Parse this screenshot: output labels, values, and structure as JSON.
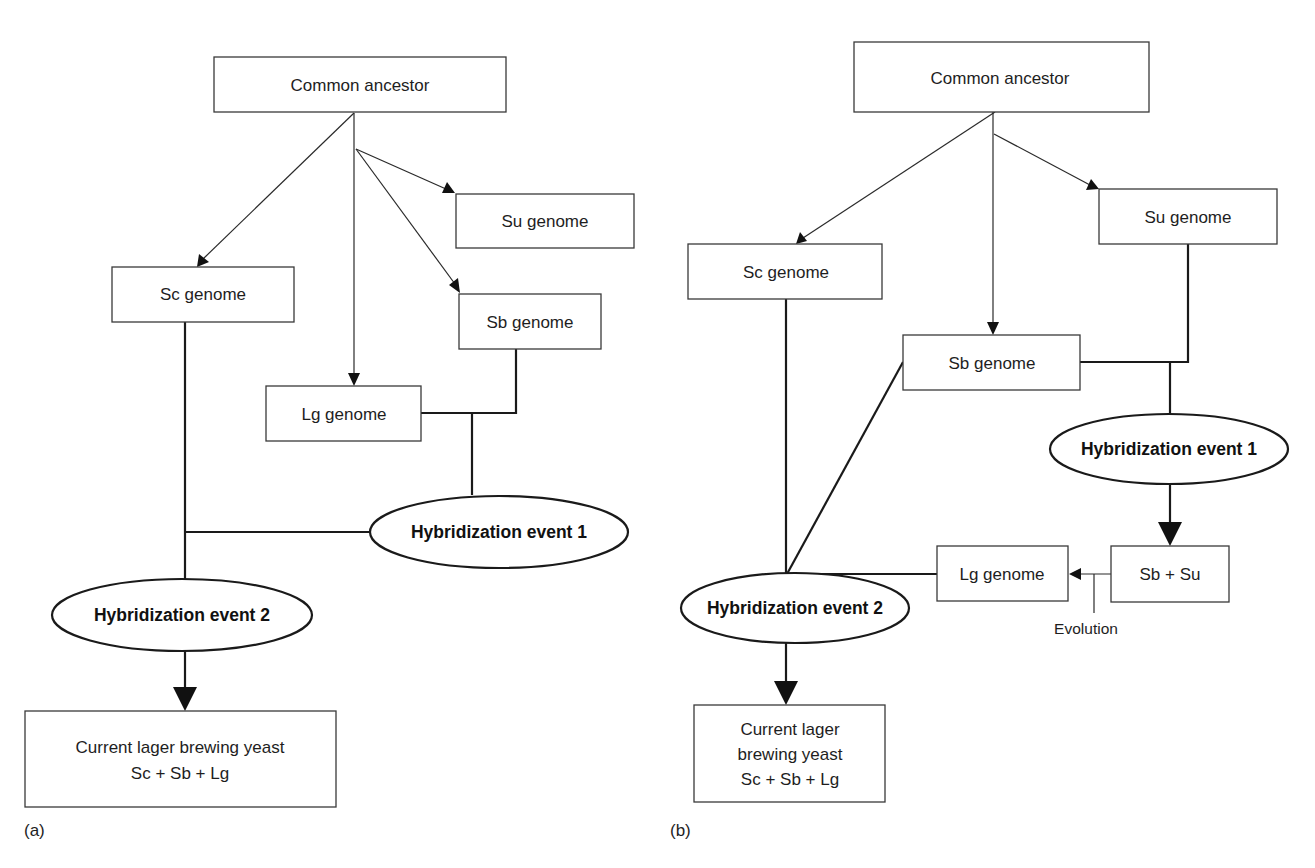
{
  "figure": {
    "panel_a": {
      "label": "(a)",
      "nodes": {
        "common_ancestor": "Common ancestor",
        "su_genome": "Su genome",
        "sc_genome": "Sc genome",
        "sb_genome": "Sb genome",
        "lg_genome": "Lg genome",
        "hybridization_1": "Hybridization event 1",
        "hybridization_2": "Hybridization event 2",
        "result_line1": "Current lager brewing yeast",
        "result_line2": "Sc + Sb + Lg"
      },
      "edges": [
        {
          "from": "Common ancestor",
          "to": "Sc genome",
          "type": "arrow"
        },
        {
          "from": "Common ancestor",
          "to": "Lg genome",
          "type": "arrow"
        },
        {
          "from": "Common ancestor",
          "to": "Su genome",
          "type": "arrow"
        },
        {
          "from": "Common ancestor",
          "to": "Sb genome",
          "type": "arrow"
        },
        {
          "from": "Lg genome",
          "to": "Hybridization event 1",
          "type": "line"
        },
        {
          "from": "Sb genome",
          "to": "Hybridization event 1",
          "type": "line"
        },
        {
          "from": "Hybridization event 1",
          "to": "Hybridization event 2",
          "type": "line"
        },
        {
          "from": "Sc genome",
          "to": "Hybridization event 2",
          "type": "line"
        },
        {
          "from": "Hybridization event 2",
          "to": "Current lager brewing yeast",
          "type": "arrow"
        }
      ]
    },
    "panel_b": {
      "label": "(b)",
      "nodes": {
        "common_ancestor": "Common ancestor",
        "su_genome": "Su genome",
        "sc_genome": "Sc genome",
        "sb_genome": "Sb genome",
        "hybridization_1": "Hybridization event 1",
        "sb_su": "Sb + Su",
        "lg_genome": "Lg genome",
        "evolution": "Evolution",
        "hybridization_2": "Hybridization event 2",
        "result_line1": "Current lager",
        "result_line2": "brewing yeast",
        "result_line3": "Sc + Sb + Lg"
      },
      "edges": [
        {
          "from": "Common ancestor",
          "to": "Sc genome",
          "type": "arrow"
        },
        {
          "from": "Common ancestor",
          "to": "Sb genome",
          "type": "arrow"
        },
        {
          "from": "Common ancestor",
          "to": "Su genome",
          "type": "arrow"
        },
        {
          "from": "Sb genome",
          "to": "Hybridization event 1",
          "type": "line"
        },
        {
          "from": "Su genome",
          "to": "Hybridization event 1",
          "type": "line"
        },
        {
          "from": "Hybridization event 1",
          "to": "Sb + Su",
          "type": "arrow"
        },
        {
          "from": "Sb + Su",
          "to": "Lg genome",
          "type": "arrow",
          "label": "Evolution"
        },
        {
          "from": "Lg genome",
          "to": "Hybridization event 2",
          "type": "line"
        },
        {
          "from": "Sb genome",
          "to": "Hybridization event 2",
          "type": "line"
        },
        {
          "from": "Sc genome",
          "to": "Hybridization event 2",
          "type": "line"
        },
        {
          "from": "Hybridization event 2",
          "to": "Current lager brewing yeast",
          "type": "arrow"
        }
      ]
    }
  }
}
